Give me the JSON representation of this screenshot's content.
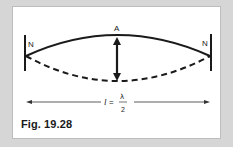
{
  "figure": {
    "caption": "Fig. 19.28",
    "labels": {
      "left_node": "N",
      "right_node": "N",
      "antinode": "A",
      "length_var": "l",
      "equals": "=",
      "numerator": "λ",
      "denominator": "2"
    },
    "colors": {
      "background": "#d6d6d6",
      "panel": "#ffffff",
      "stroke": "#1a1a1a",
      "dimension_line": "#333333"
    }
  }
}
